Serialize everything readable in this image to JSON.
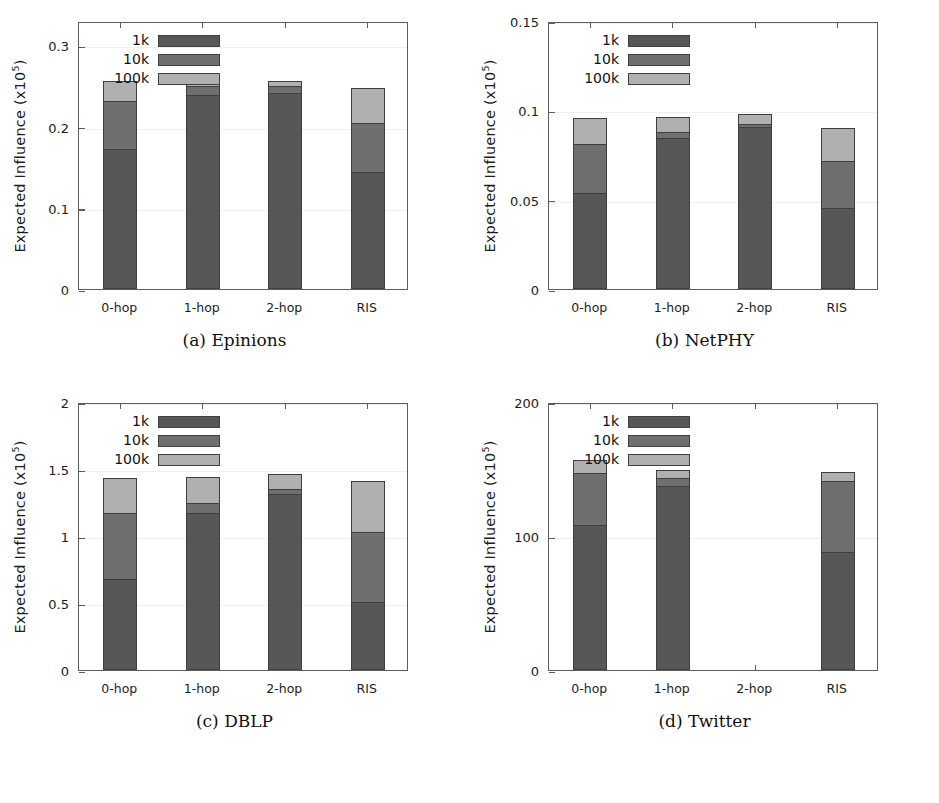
{
  "figure": {
    "ylabel_text": "Expected Influence (x10",
    "ylabel_sup": "5",
    "ylabel_close": ")",
    "legend": [
      {
        "label": "1k",
        "color": "#575757"
      },
      {
        "label": "10k",
        "color": "#6f6f6f"
      },
      {
        "label": "100k",
        "color": "#b0b0b0"
      }
    ],
    "categories": [
      "0-hop",
      "1-hop",
      "2-hop",
      "RIS"
    ]
  },
  "chart_data": [
    {
      "type": "bar",
      "id": "epinions",
      "caption": "(a) Epinions",
      "title": "",
      "xlabel": "",
      "ylabel": "Expected Influence (x10^5)",
      "stacked": true,
      "categories": [
        "0-hop",
        "1-hop",
        "2-hop",
        "RIS"
      ],
      "yticks": [
        0,
        0.1,
        0.2,
        0.3
      ],
      "ytick_labels": [
        "0",
        "0.1",
        "0.2",
        "0.3"
      ],
      "ylim": [
        0,
        0.33
      ],
      "grid": true,
      "legend_position": "upper-left",
      "series": [
        {
          "name": "1k",
          "values": [
            0.172,
            0.239,
            0.241,
            0.144
          ]
        },
        {
          "name": "10k",
          "values": [
            0.232,
            0.25,
            0.25,
            0.204
          ]
        },
        {
          "name": "100k",
          "values": [
            0.256,
            0.256,
            0.256,
            0.247
          ]
        }
      ],
      "note": "series values are cumulative stack tops"
    },
    {
      "type": "bar",
      "id": "netphy",
      "caption": "(b) NetPHY",
      "title": "",
      "xlabel": "",
      "ylabel": "Expected Influence (x10^5)",
      "stacked": true,
      "categories": [
        "0-hop",
        "1-hop",
        "2-hop",
        "RIS"
      ],
      "yticks": [
        0,
        0.05,
        0.1,
        0.15
      ],
      "ytick_labels": [
        "0",
        "0.05",
        "0.1",
        "0.15"
      ],
      "ylim": [
        0,
        0.15
      ],
      "grid": true,
      "legend_position": "upper-left",
      "series": [
        {
          "name": "1k",
          "values": [
            0.0535,
            0.0845,
            0.0905,
            0.0455
          ]
        },
        {
          "name": "10k",
          "values": [
            0.081,
            0.088,
            0.0925,
            0.0715
          ]
        },
        {
          "name": "100k",
          "values": [
            0.0955,
            0.0965,
            0.098,
            0.09
          ]
        }
      ],
      "note": "series values are cumulative stack tops"
    },
    {
      "type": "bar",
      "id": "dblp",
      "caption": "(c) DBLP",
      "title": "",
      "xlabel": "",
      "ylabel": "Expected Influence (x10^5)",
      "stacked": true,
      "categories": [
        "0-hop",
        "1-hop",
        "2-hop",
        "RIS"
      ],
      "yticks": [
        0,
        0.5,
        1,
        1.5,
        2
      ],
      "ytick_labels": [
        "0",
        "0.5",
        "1",
        "1.5",
        "2"
      ],
      "ylim": [
        0,
        2
      ],
      "grid": true,
      "legend_position": "upper-left",
      "series": [
        {
          "name": "1k",
          "values": [
            0.68,
            1.17,
            1.31,
            0.51
          ]
        },
        {
          "name": "10k",
          "values": [
            1.17,
            1.25,
            1.35,
            1.03
          ]
        },
        {
          "name": "100k",
          "values": [
            1.43,
            1.44,
            1.46,
            1.41
          ]
        }
      ],
      "note": "series values are cumulative stack tops"
    },
    {
      "type": "bar",
      "id": "twitter",
      "caption": "(d) Twitter",
      "title": "",
      "xlabel": "",
      "ylabel": "Expected Influence (x10^5)",
      "stacked": true,
      "categories": [
        "0-hop",
        "1-hop",
        "2-hop",
        "RIS"
      ],
      "yticks": [
        0,
        100,
        200
      ],
      "ytick_labels": [
        "0",
        "100",
        "200"
      ],
      "ylim": [
        0,
        200
      ],
      "grid": true,
      "legend_position": "upper-left",
      "series": [
        {
          "name": "1k",
          "values": [
            108,
            137,
            null,
            88
          ]
        },
        {
          "name": "10k",
          "values": [
            147,
            143,
            null,
            141
          ]
        },
        {
          "name": "100k",
          "values": [
            157,
            149,
            null,
            148
          ]
        }
      ],
      "note": "series values are cumulative stack tops; 2-hop has no data"
    }
  ]
}
